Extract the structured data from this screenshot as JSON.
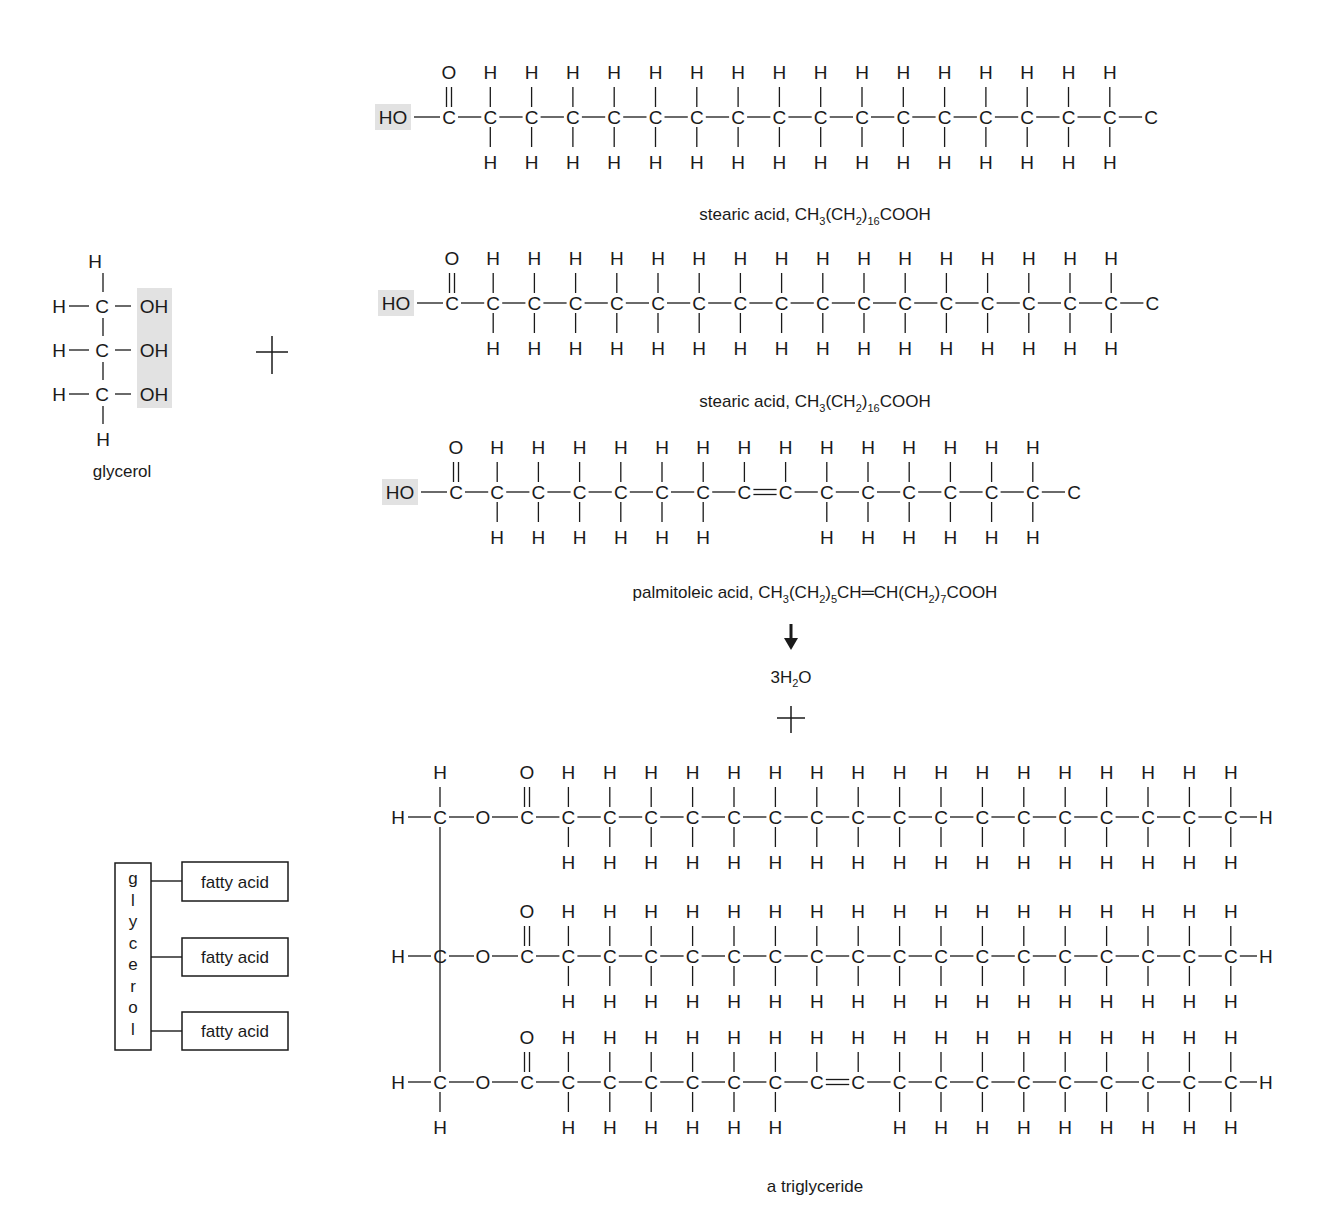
{
  "glycerol": {
    "label": "glycerol",
    "oh_groups": [
      "OH",
      "OH",
      "OH"
    ],
    "h_top": "H",
    "h_bottom": "H",
    "h_left": [
      "H",
      "H",
      "H"
    ],
    "carbons": [
      "C",
      "C",
      "C"
    ]
  },
  "reaction": {
    "plus_1": "+",
    "plus_2": "+",
    "arrow": "down-arrow",
    "water": {
      "prefix": "3H",
      "sub": "2",
      "suffix": "O"
    }
  },
  "fatty_acids": [
    {
      "name": "stearic acid",
      "caption_parts": [
        {
          "t": "stearic acid, CH"
        },
        {
          "s": "3"
        },
        {
          "t": "(CH"
        },
        {
          "s": "2"
        },
        {
          "t": ")"
        },
        {
          "s": "16"
        },
        {
          "t": "COOH"
        }
      ],
      "carboxyl_head": "HO",
      "chain_carbons": 18,
      "double_bond_after": null,
      "terminal": "C",
      "x0": 449,
      "dx": 41.3,
      "y": 117,
      "caption_y": 220
    },
    {
      "name": "stearic acid",
      "caption_parts": [
        {
          "t": "stearic acid, CH"
        },
        {
          "s": "3"
        },
        {
          "t": "(CH"
        },
        {
          "s": "2"
        },
        {
          "t": ")"
        },
        {
          "s": "16"
        },
        {
          "t": "COOH"
        }
      ],
      "carboxyl_head": "HO",
      "chain_carbons": 18,
      "double_bond_after": null,
      "terminal": "C",
      "x0": 452,
      "dx": 41.2,
      "y": 303,
      "caption_y": 407
    },
    {
      "name": "palmitoleic acid",
      "caption_parts": [
        {
          "t": "palmitoleic acid, CH"
        },
        {
          "s": "3"
        },
        {
          "t": "(CH"
        },
        {
          "s": "2"
        },
        {
          "t": ")"
        },
        {
          "s": "5"
        },
        {
          "t": "CH=CH(CH"
        },
        {
          "s": "2"
        },
        {
          "t": ")"
        },
        {
          "s": "7"
        },
        {
          "t": "COOH"
        }
      ],
      "carboxyl_head": "HO",
      "chain_carbons": 16,
      "double_bond_after": 7,
      "terminal": "C",
      "x0": 456,
      "dx": 41.2,
      "y": 492,
      "caption_y": 598
    }
  ],
  "triglyceride": {
    "label": "a triglyceride",
    "backbone_x": 440,
    "rows": [
      {
        "y": 817,
        "chain_carbons": 18,
        "double_bond_after": null,
        "h_top": "H",
        "h_bottom": null
      },
      {
        "y": 956,
        "chain_carbons": 18,
        "double_bond_after": null,
        "h_top": null,
        "h_bottom": null
      },
      {
        "y": 1082,
        "chain_carbons": 18,
        "double_bond_after": 7,
        "h_top": null,
        "h_bottom": "H"
      }
    ],
    "ester_o": "O",
    "terminal_h": "H",
    "x0": 527,
    "dx": 41.4
  },
  "schematic": {
    "backbone_letters": [
      "g",
      "l",
      "y",
      "c",
      "e",
      "r",
      "o",
      "l"
    ],
    "fatty_acid_labels": [
      "fatty acid",
      "fatty acid",
      "fatty acid"
    ]
  }
}
